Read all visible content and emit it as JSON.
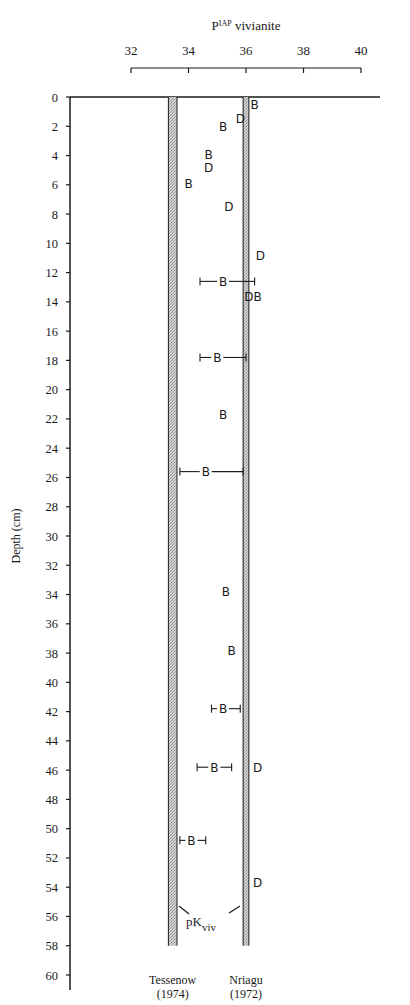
{
  "chart_data": {
    "type": "scatter",
    "title": "",
    "xlabel": "P^IAP vivianite",
    "xlabel_main": "P",
    "xlabel_sup": "IAP",
    "xlabel_rest": " vivianite",
    "ylabel": "Depth (cm)",
    "xlim": [
      32,
      40
    ],
    "ylim": [
      0,
      60
    ],
    "y_inverted": true,
    "x_ticks": [
      32,
      34,
      36,
      38,
      40
    ],
    "y_ticks": [
      0,
      2,
      4,
      6,
      8,
      10,
      12,
      14,
      16,
      18,
      20,
      22,
      24,
      26,
      28,
      30,
      32,
      34,
      36,
      38,
      40,
      42,
      44,
      46,
      48,
      50,
      52,
      54,
      56,
      58,
      60
    ],
    "grid": false,
    "series": [
      {
        "name": "B",
        "marker": "B",
        "points": [
          {
            "x": 36.3,
            "y": 0.5
          },
          {
            "x": 35.2,
            "y": 2.0
          },
          {
            "x": 34.7,
            "y": 3.9
          },
          {
            "x": 34.0,
            "y": 5.9
          },
          {
            "x": 35.2,
            "y": 12.6,
            "xerr_low": 34.4,
            "xerr_high": 36.3
          },
          {
            "x": 36.4,
            "y": 13.6
          },
          {
            "x": 35.0,
            "y": 17.8,
            "xerr_low": 34.4,
            "xerr_high": 36.0
          },
          {
            "x": 35.2,
            "y": 21.7
          },
          {
            "x": 34.6,
            "y": 25.6,
            "xerr_low": 33.7,
            "xerr_high": 35.9
          },
          {
            "x": 35.3,
            "y": 33.8
          },
          {
            "x": 35.5,
            "y": 37.8
          },
          {
            "x": 35.2,
            "y": 41.8,
            "xerr_low": 34.8,
            "xerr_high": 35.8
          },
          {
            "x": 34.9,
            "y": 45.8,
            "xerr_low": 34.3,
            "xerr_high": 35.5
          },
          {
            "x": 34.1,
            "y": 50.8,
            "xerr_low": 33.7,
            "xerr_high": 34.6
          }
        ]
      },
      {
        "name": "D",
        "marker": "D",
        "points": [
          {
            "x": 35.8,
            "y": 1.5
          },
          {
            "x": 34.7,
            "y": 4.8
          },
          {
            "x": 35.4,
            "y": 7.5
          },
          {
            "x": 36.5,
            "y": 10.8
          },
          {
            "x": 36.1,
            "y": 13.6
          },
          {
            "x": 36.4,
            "y": 45.8
          },
          {
            "x": 36.4,
            "y": 53.7
          }
        ]
      }
    ],
    "bands": [
      {
        "name": "Tessenow (1974)",
        "label_line1": "Tessenow",
        "label_line2": "(1974)",
        "x_low": 33.3,
        "x_high": 33.6,
        "y_from": 0,
        "y_to": 58
      },
      {
        "name": "Nriagu (1972)",
        "label_line1": "Nriagu",
        "label_line2": "(1972)",
        "x_low": 35.9,
        "x_high": 36.1,
        "y_from": 0,
        "y_to": 58
      }
    ],
    "annotation": {
      "text_main": "pK",
      "text_sub": "viv",
      "points_to": [
        "Tessenow (1974)",
        "Nriagu (1972)"
      ]
    },
    "legend": null
  },
  "colors": {
    "ink": "#1a1a1a",
    "band_fill": "#bdbdbd",
    "background": "#ffffff"
  }
}
